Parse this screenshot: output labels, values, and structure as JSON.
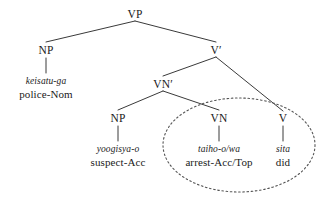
{
  "figure": {
    "kind": "syntax-tree",
    "background_color": "#ffffff",
    "line_color": "#3a3a3a",
    "text_color": "#1a1a1a",
    "width": 329,
    "height": 203
  },
  "nodes": {
    "vp": {
      "label": "VP",
      "x": 135,
      "y": 14
    },
    "np_subject": {
      "label": "NP",
      "x": 46,
      "y": 50
    },
    "vbar": {
      "label": "V′",
      "x": 216,
      "y": 50
    },
    "vnbar": {
      "label": "VN′",
      "x": 163,
      "y": 84
    },
    "np_object": {
      "label": "NP",
      "x": 118,
      "y": 118
    },
    "vn": {
      "label": "VN",
      "x": 219,
      "y": 118
    },
    "v": {
      "label": "V",
      "x": 283,
      "y": 118
    }
  },
  "leaves": {
    "subject": {
      "form": "keisatu-ga",
      "gloss": "police-Nom",
      "x": 46,
      "y": 152
    },
    "object": {
      "form": "yoogisya-o",
      "gloss": "suspect-Acc",
      "x": 118,
      "y": 152
    },
    "vn_leaf": {
      "form": "taiho-o/wa",
      "gloss": "arrest-Acc/Top",
      "x": 219,
      "y": 152
    },
    "v_leaf": {
      "form": "sita",
      "gloss": "did",
      "x": 283,
      "y": 152
    }
  },
  "annotation": {
    "ellipse_name": "complex-predicate-circle",
    "style": "dotted",
    "cx": 239,
    "cy": 145,
    "rx": 76,
    "ry": 47,
    "stroke": "#555555"
  },
  "edges": [
    {
      "name": "vp-to-np",
      "x1": 135,
      "y1": 21,
      "x2": 46,
      "y2": 42
    },
    {
      "name": "vp-to-vbar",
      "x1": 135,
      "y1": 21,
      "x2": 216,
      "y2": 42
    },
    {
      "name": "vbar-to-vnbar",
      "x1": 216,
      "y1": 57,
      "x2": 163,
      "y2": 76
    },
    {
      "name": "vbar-to-v",
      "x1": 216,
      "y1": 57,
      "x2": 283,
      "y2": 111
    },
    {
      "name": "vnbar-to-np",
      "x1": 163,
      "y1": 91,
      "x2": 118,
      "y2": 110
    },
    {
      "name": "vnbar-to-vn",
      "x1": 163,
      "y1": 91,
      "x2": 219,
      "y2": 110
    },
    {
      "name": "np-subject-to-leaf",
      "x1": 46,
      "y1": 57,
      "x2": 46,
      "y2": 72
    },
    {
      "name": "np-object-to-leaf",
      "x1": 118,
      "y1": 125,
      "x2": 118,
      "y2": 140
    },
    {
      "name": "vn-to-leaf",
      "x1": 219,
      "y1": 125,
      "x2": 219,
      "y2": 140
    },
    {
      "name": "v-to-leaf",
      "x1": 283,
      "y1": 125,
      "x2": 283,
      "y2": 140
    }
  ]
}
